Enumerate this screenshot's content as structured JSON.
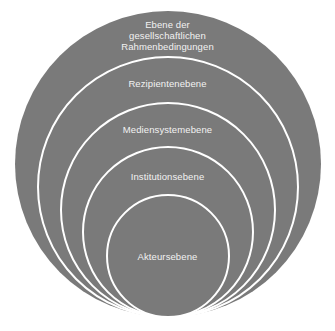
{
  "diagram": {
    "type": "nested-concentric-circles",
    "colors": {
      "fill": "#7a7a7a",
      "stroke": "#ffffff",
      "text": "#f2f2f2",
      "background": "#ffffff"
    },
    "levels": [
      {
        "label_lines": [
          "Ebene der",
          "gesellschaftlichen",
          "Rahmenbedingungen"
        ]
      },
      {
        "label_lines": [
          "Rezipientenebene"
        ]
      },
      {
        "label_lines": [
          "Mediensystemebene"
        ]
      },
      {
        "label_lines": [
          "Institutionsebene"
        ]
      },
      {
        "label_lines": [
          "Akteursebene"
        ]
      }
    ]
  }
}
